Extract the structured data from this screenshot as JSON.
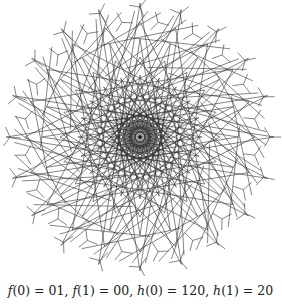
{
  "figure": {
    "stroke_color": "#333333",
    "background": "#ffffff",
    "center": [
      140,
      137
    ],
    "radius": 134,
    "symmetry_order": 20,
    "central_rays": 20
  },
  "caption": {
    "text": "f(0) = 01, f(1) = 00, h(0) = 120, h(1) = 20",
    "parts": [
      {
        "fn": "f",
        "arg": "0",
        "value": "01"
      },
      {
        "fn": "f",
        "arg": "1",
        "value": "00"
      },
      {
        "fn": "h",
        "arg": "0",
        "value": "120"
      },
      {
        "fn": "h",
        "arg": "1",
        "value": "20"
      }
    ]
  }
}
